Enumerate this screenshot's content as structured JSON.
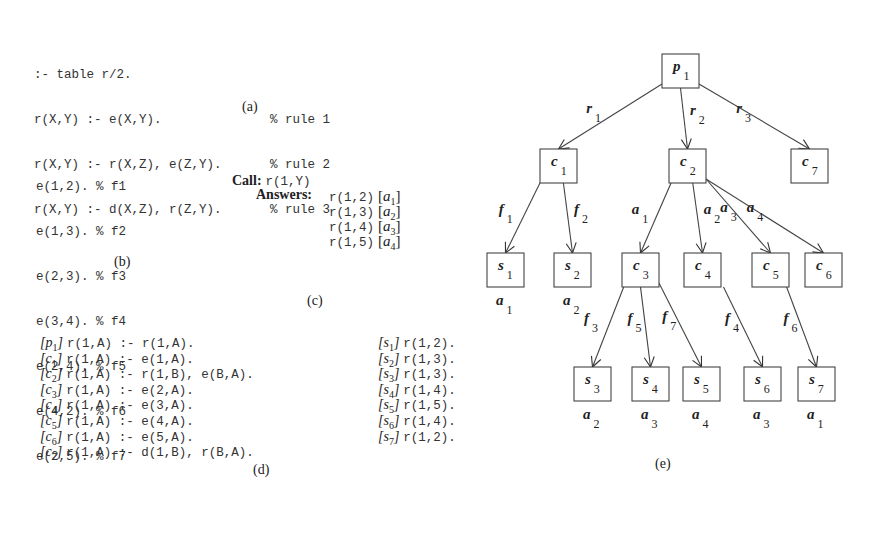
{
  "panel_a": {
    "caption": "(a)",
    "lines": [
      {
        "code": ":- table r/2.",
        "comment": ""
      },
      {
        "code": "r(X,Y) :- e(X,Y).",
        "comment": "% rule 1"
      },
      {
        "code": "r(X,Y) :- r(X,Z), e(Z,Y).",
        "comment": "% rule 2"
      },
      {
        "code": "r(X,Y) :- d(X,Z), r(Z,Y).",
        "comment": "% rule 3"
      }
    ]
  },
  "panel_b": {
    "caption": "(b)",
    "facts": [
      {
        "code": "e(1,2).",
        "comment": "% f1"
      },
      {
        "code": "e(1,3).",
        "comment": "% f2"
      },
      {
        "code": "e(2,3).",
        "comment": "% f3"
      },
      {
        "code": "e(3,4).",
        "comment": "% f4"
      },
      {
        "code": "e(2,4).",
        "comment": "% f5"
      },
      {
        "code": "e(4,2).",
        "comment": "% f6"
      },
      {
        "code": "e(2,5).",
        "comment": "% f7"
      }
    ]
  },
  "panel_c": {
    "caption": "(c)",
    "call_label": "Call:",
    "call": "r(1,Y)",
    "answers_label": "Answers:",
    "answers": [
      {
        "term": "r(1,2)",
        "tag": "a",
        "sub": "1"
      },
      {
        "term": "r(1,3)",
        "tag": "a",
        "sub": "2"
      },
      {
        "term": "r(1,4)",
        "tag": "a",
        "sub": "3"
      },
      {
        "term": "r(1,5)",
        "tag": "a",
        "sub": "4"
      }
    ]
  },
  "panel_d": {
    "caption": "(d)",
    "clauses": [
      {
        "tag": "p",
        "sub": "1",
        "code": "r(1,A) :- r(1,A)."
      },
      {
        "tag": "c",
        "sub": "1",
        "code": "r(1,A) :- e(1,A)."
      },
      {
        "tag": "c",
        "sub": "2",
        "code": "r(1,A) :- r(1,B), e(B,A)."
      },
      {
        "tag": "c",
        "sub": "3",
        "code": "r(1,A) :- e(2,A)."
      },
      {
        "tag": "c",
        "sub": "4",
        "code": "r(1,A) :- e(3,A)."
      },
      {
        "tag": "c",
        "sub": "5",
        "code": "r(1,A) :- e(4,A)."
      },
      {
        "tag": "c",
        "sub": "6",
        "code": "r(1,A) :- e(5,A)."
      },
      {
        "tag": "c",
        "sub": "7",
        "code": "r(1,A) :- d(1,B), r(B,A)."
      }
    ],
    "solutions": [
      {
        "tag": "s",
        "sub": "1",
        "code": "r(1,2)."
      },
      {
        "tag": "s",
        "sub": "2",
        "code": "r(1,3)."
      },
      {
        "tag": "s",
        "sub": "3",
        "code": "r(1,3)."
      },
      {
        "tag": "s",
        "sub": "4",
        "code": "r(1,4)."
      },
      {
        "tag": "s",
        "sub": "5",
        "code": "r(1,5)."
      },
      {
        "tag": "s",
        "sub": "6",
        "code": "r(1,4)."
      },
      {
        "tag": "s",
        "sub": "7",
        "code": "r(1,2)."
      }
    ]
  },
  "panel_e": {
    "caption": "(e)",
    "nodes": [
      {
        "id": "p1",
        "letter": "p",
        "sub": "1",
        "x": 662,
        "y": 54,
        "below": ""
      },
      {
        "id": "c1",
        "letter": "c",
        "sub": "1",
        "x": 540,
        "y": 149,
        "below": ""
      },
      {
        "id": "c2",
        "letter": "c",
        "sub": "2",
        "x": 669,
        "y": 149,
        "below": ""
      },
      {
        "id": "c7",
        "letter": "c",
        "sub": "7",
        "x": 791,
        "y": 149,
        "below": ""
      },
      {
        "id": "s1",
        "letter": "s",
        "sub": "1",
        "x": 487,
        "y": 253,
        "below": "a1"
      },
      {
        "id": "s2",
        "letter": "s",
        "sub": "2",
        "x": 554,
        "y": 253,
        "below": "a2"
      },
      {
        "id": "c3",
        "letter": "c",
        "sub": "3",
        "x": 622,
        "y": 253,
        "below": ""
      },
      {
        "id": "c4",
        "letter": "c",
        "sub": "4",
        "x": 684,
        "y": 253,
        "below": ""
      },
      {
        "id": "c5",
        "letter": "c",
        "sub": "5",
        "x": 752,
        "y": 253,
        "below": ""
      },
      {
        "id": "c6",
        "letter": "c",
        "sub": "6",
        "x": 805,
        "y": 253,
        "below": ""
      },
      {
        "id": "s3",
        "letter": "s",
        "sub": "3",
        "x": 574,
        "y": 367,
        "below": "a2"
      },
      {
        "id": "s4",
        "letter": "s",
        "sub": "4",
        "x": 632,
        "y": 367,
        "below": "a3"
      },
      {
        "id": "s5",
        "letter": "s",
        "sub": "5",
        "x": 683,
        "y": 367,
        "below": "a4"
      },
      {
        "id": "s6",
        "letter": "s",
        "sub": "6",
        "x": 744,
        "y": 367,
        "below": "a3"
      },
      {
        "id": "s7",
        "letter": "s",
        "sub": "7",
        "x": 798,
        "y": 367,
        "below": "a1"
      }
    ],
    "edges": [
      {
        "from": "p1",
        "to": "c1",
        "label": "r",
        "sub": "1"
      },
      {
        "from": "p1",
        "to": "c2",
        "label": "r",
        "sub": "2"
      },
      {
        "from": "p1",
        "to": "c7",
        "label": "r",
        "sub": "3"
      },
      {
        "from": "c1",
        "to": "s1",
        "label": "f",
        "sub": "1"
      },
      {
        "from": "c1",
        "to": "s2",
        "label": "f",
        "sub": "2"
      },
      {
        "from": "c2",
        "to": "c3",
        "label": "a",
        "sub": "1"
      },
      {
        "from": "c2",
        "to": "c4",
        "label": "a",
        "sub": "2"
      },
      {
        "from": "c2",
        "to": "c5",
        "label": "a",
        "sub": "3"
      },
      {
        "from": "c2",
        "to": "c6",
        "label": "a",
        "sub": "4"
      },
      {
        "from": "c3",
        "to": "s3",
        "label": "f",
        "sub": "3"
      },
      {
        "from": "c3",
        "to": "s4",
        "label": "f",
        "sub": "5"
      },
      {
        "from": "c3",
        "to": "s5",
        "label": "f",
        "sub": "7"
      },
      {
        "from": "c4",
        "to": "s6",
        "label": "f",
        "sub": "4"
      },
      {
        "from": "c5",
        "to": "s7",
        "label": "f",
        "sub": "6"
      }
    ]
  }
}
